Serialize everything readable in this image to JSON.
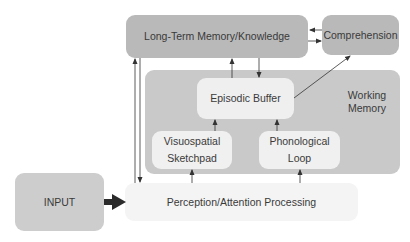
{
  "diagram": {
    "type": "flow-diagram",
    "nodes": {
      "long_term_memory": "Long-Term Memory/Knowledge",
      "comprehension": "Comprehension",
      "working_memory": "Working\nMemory",
      "episodic_buffer": "Episodic Buffer",
      "visuospatial_sketchpad": "Visuospatial\nSketchpad",
      "phonological_loop": "Phonological\nLoop",
      "input": "INPUT",
      "perception": "Perception/Attention Processing"
    },
    "edges": [
      {
        "from": "input",
        "to": "perception",
        "style": "thick"
      },
      {
        "from": "perception",
        "to": "long_term_memory"
      },
      {
        "from": "long_term_memory",
        "to": "perception"
      },
      {
        "from": "perception",
        "to": "visuospatial_sketchpad"
      },
      {
        "from": "perception",
        "to": "phonological_loop"
      },
      {
        "from": "visuospatial_sketchpad",
        "to": "episodic_buffer"
      },
      {
        "from": "phonological_loop",
        "to": "episodic_buffer"
      },
      {
        "from": "episodic_buffer",
        "to": "long_term_memory"
      },
      {
        "from": "long_term_memory",
        "to": "episodic_buffer"
      },
      {
        "from": "episodic_buffer",
        "to": "comprehension"
      },
      {
        "from": "comprehension",
        "to": "long_term_memory"
      },
      {
        "from": "long_term_memory",
        "to": "comprehension"
      }
    ]
  },
  "colors": {
    "dark_box": "#b9b9b9",
    "working_memory_bg": "#c9c9c9",
    "light_box": "#efefef",
    "input_box": "#cdcdcd",
    "perception_box": "#f4f4f4",
    "arrow": "#333333"
  }
}
